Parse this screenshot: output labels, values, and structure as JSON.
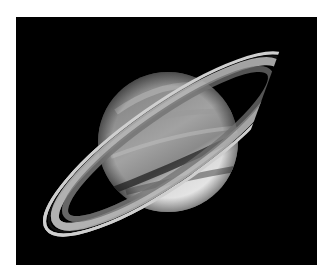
{
  "image": {
    "subject": "Saturn with rings",
    "background_color": "#000000",
    "page_background": "#ffffff",
    "planet": {
      "center": [
        152,
        125
      ],
      "radius": 70,
      "colors": {
        "north": "#8f8f8f",
        "south": "#e8e8e8",
        "bands": "#b5b5b5"
      }
    },
    "rings": {
      "center": [
        152,
        127
      ],
      "rx": 148,
      "ry": 36,
      "rotation_deg": -35,
      "colors": {
        "outer": "#c9c9c9",
        "gap": "#111111",
        "inner": "#7a7a7a"
      }
    }
  }
}
